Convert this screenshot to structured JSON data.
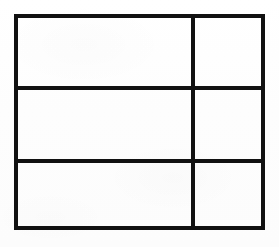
{
  "figure": {
    "type": "grid-table-diagram",
    "title": "",
    "background_color": "#fefefe",
    "line_color": "#111111",
    "line_width_outer": 4,
    "line_width_inner": 3,
    "outer_rect": {
      "x": 14,
      "y": 14,
      "width": 251,
      "height": 216
    },
    "columns": [
      {
        "id": "col-left",
        "label": "",
        "x": 14,
        "width": 179
      },
      {
        "id": "col-right",
        "label": "",
        "x": 193,
        "width": 72
      }
    ],
    "rows": [
      {
        "id": "row-1",
        "label": "",
        "y": 14,
        "height": 74
      },
      {
        "id": "row-2",
        "label": "",
        "y": 88,
        "height": 73
      },
      {
        "id": "row-3",
        "label": "",
        "y": 161,
        "height": 69
      }
    ],
    "vertical_dividers": [
      {
        "id": "v-divider-1",
        "x": 193,
        "y1": 14,
        "y2": 230
      }
    ],
    "horizontal_dividers": [
      {
        "id": "h-divider-1",
        "y": 88,
        "x1": 14,
        "x2": 265
      },
      {
        "id": "h-divider-2",
        "y": 161,
        "x1": 14,
        "x2": 265
      }
    ],
    "cells": [
      {
        "id": "cell-r1c1",
        "row": 1,
        "col": 1,
        "text": "",
        "x": 14,
        "y": 14,
        "width": 179,
        "height": 74
      },
      {
        "id": "cell-r1c2",
        "row": 1,
        "col": 2,
        "text": "",
        "x": 193,
        "y": 14,
        "width": 72,
        "height": 74
      },
      {
        "id": "cell-r2c1",
        "row": 2,
        "col": 1,
        "text": "",
        "x": 14,
        "y": 88,
        "width": 179,
        "height": 73
      },
      {
        "id": "cell-r2c2",
        "row": 2,
        "col": 2,
        "text": "",
        "x": 193,
        "y": 88,
        "width": 72,
        "height": 73
      },
      {
        "id": "cell-r3c1",
        "row": 3,
        "col": 1,
        "text": "",
        "x": 14,
        "y": 161,
        "width": 179,
        "height": 69
      },
      {
        "id": "cell-r3c2",
        "row": 3,
        "col": 2,
        "text": "",
        "x": 193,
        "y": 161,
        "width": 72,
        "height": 69
      }
    ]
  }
}
